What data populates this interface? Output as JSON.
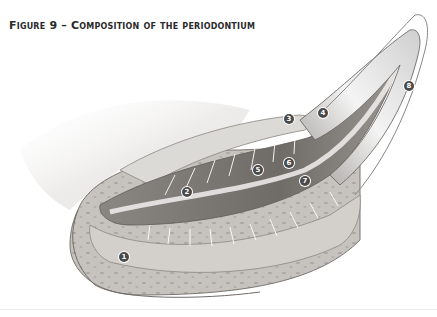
{
  "figure": {
    "title_prefix": "Figure 9",
    "title_dash": " – ",
    "title_text": "Composition of the periodontium"
  },
  "labels": [
    {
      "n": "1",
      "x": 124,
      "y": 257
    },
    {
      "n": "2",
      "x": 187,
      "y": 192
    },
    {
      "n": "3",
      "x": 289,
      "y": 119
    },
    {
      "n": "4",
      "x": 323,
      "y": 113
    },
    {
      "n": "5",
      "x": 258,
      "y": 170
    },
    {
      "n": "6",
      "x": 289,
      "y": 163
    },
    {
      "n": "7",
      "x": 305,
      "y": 181
    },
    {
      "n": "8",
      "x": 409,
      "y": 86
    }
  ],
  "colors": {
    "bone": "#c9c6c2",
    "bone_dark": "#a9a5a0",
    "root": "#7d7975",
    "dentin_light": "#e8e8e8",
    "outline": "#6f6b68",
    "badge": "#4a4a4a"
  }
}
